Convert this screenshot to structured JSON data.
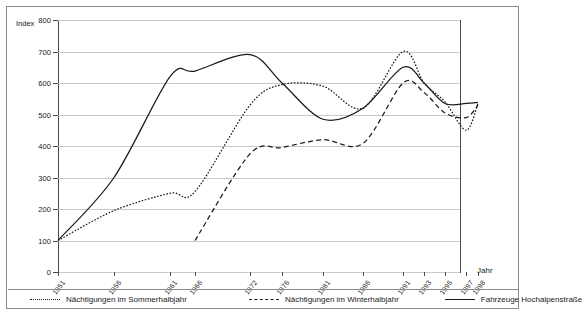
{
  "chart_data": {
    "type": "line",
    "title": "",
    "xlabel": "Jahr",
    "ylabel": "Index",
    "ylim": [
      0,
      800
    ],
    "ytick_step": 100,
    "yticks": [
      0,
      100,
      200,
      300,
      400,
      500,
      600,
      700,
      800
    ],
    "grid": true,
    "legend_position": "bottom",
    "categories": [
      "1951",
      "1956",
      "1961",
      "1966",
      "1972",
      "1976",
      "1981",
      "1986",
      "1991",
      "1993",
      "1995",
      "1997",
      "1998"
    ],
    "x_tick_positions_px": [
      0,
      56,
      112,
      137,
      192,
      224,
      265,
      305,
      345,
      366,
      387,
      408,
      420
    ],
    "series": [
      {
        "name": "Nächtigungen im Sommerhalbjahr",
        "style": "dotted",
        "color": "#1a1a1a",
        "x": [
          "1951",
          "1956",
          "1961",
          "1966",
          "1972",
          "1976",
          "1981",
          "1986",
          "1991",
          "1993",
          "1995",
          "1997",
          "1998"
        ],
        "values": [
          100,
          195,
          250,
          255,
          530,
          595,
          590,
          520,
          700,
          600,
          540,
          450,
          535
        ]
      },
      {
        "name": "Nächtigungen im Winterhalbjahr",
        "style": "dashed",
        "color": "#1a1a1a",
        "x": [
          "1966",
          "1972",
          "1976",
          "1981",
          "1986",
          "1991",
          "1993",
          "1995",
          "1997",
          "1998"
        ],
        "values": [
          100,
          375,
          395,
          420,
          408,
          600,
          570,
          505,
          490,
          530
        ]
      },
      {
        "name": "Fahrzeuge Hochalpenstraße",
        "style": "solid",
        "color": "#1a1a1a",
        "x": [
          "1951",
          "1956",
          "1961",
          "1966",
          "1972",
          "1976",
          "1981",
          "1986",
          "1991",
          "1993",
          "1995",
          "1997",
          "1998"
        ],
        "values": [
          100,
          300,
          620,
          638,
          690,
          600,
          485,
          520,
          650,
          600,
          535,
          535,
          538
        ]
      }
    ]
  },
  "axes": {
    "y_title": "Index",
    "x_title": "Jahr",
    "y_tick_labels": [
      "800",
      "700",
      "600",
      "500",
      "400",
      "300",
      "200",
      "100",
      "0"
    ],
    "x_tick_labels": [
      "1951",
      "1956",
      "1961",
      "1966",
      "1972",
      "1976",
      "1981",
      "1986",
      "1991",
      "1993",
      "1995",
      "1997",
      "1998"
    ]
  },
  "legend": {
    "items": [
      {
        "label": "Nächtigungen im Sommerhalbjahr",
        "style": "dotted"
      },
      {
        "label": "Nächtigungen im Winterhalbjahr",
        "style": "dashed"
      },
      {
        "label": "Fahrzeuge Hochalpenstraße",
        "style": "solid"
      }
    ]
  }
}
